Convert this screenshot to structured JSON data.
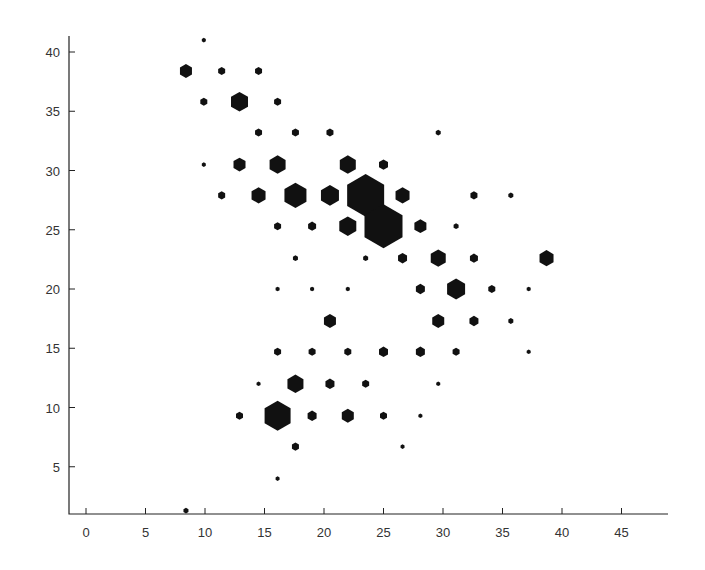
{
  "chart_data": {
    "type": "scatter",
    "subtype": "hexbin",
    "title": "",
    "xlabel": "",
    "ylabel": "",
    "xlim": [
      -1.5,
      49
    ],
    "ylim": [
      1,
      41.5
    ],
    "xticks": [
      0,
      5,
      10,
      15,
      20,
      25,
      30,
      35,
      40,
      45
    ],
    "yticks": [
      5,
      10,
      15,
      20,
      25,
      30,
      35,
      40
    ],
    "grid": false,
    "legend": null,
    "marker": "hexagon (size proportional to count)",
    "color": "#111111",
    "points": [
      {
        "x": 9.9,
        "y": 41.0,
        "size": 4
      },
      {
        "x": 8.4,
        "y": 38.4,
        "size": 12
      },
      {
        "x": 11.4,
        "y": 38.4,
        "size": 7
      },
      {
        "x": 14.5,
        "y": 38.4,
        "size": 7
      },
      {
        "x": 9.9,
        "y": 35.8,
        "size": 7
      },
      {
        "x": 12.9,
        "y": 35.8,
        "size": 17
      },
      {
        "x": 16.1,
        "y": 35.8,
        "size": 7
      },
      {
        "x": 14.5,
        "y": 33.2,
        "size": 7
      },
      {
        "x": 17.6,
        "y": 33.2,
        "size": 7
      },
      {
        "x": 20.5,
        "y": 33.2,
        "size": 7
      },
      {
        "x": 29.6,
        "y": 33.2,
        "size": 5
      },
      {
        "x": 9.9,
        "y": 30.5,
        "size": 4
      },
      {
        "x": 12.9,
        "y": 30.5,
        "size": 12
      },
      {
        "x": 16.1,
        "y": 30.5,
        "size": 16
      },
      {
        "x": 22.0,
        "y": 30.5,
        "size": 16
      },
      {
        "x": 25.0,
        "y": 30.5,
        "size": 9
      },
      {
        "x": 11.4,
        "y": 27.9,
        "size": 7
      },
      {
        "x": 14.5,
        "y": 27.9,
        "size": 14
      },
      {
        "x": 17.6,
        "y": 27.9,
        "size": 22
      },
      {
        "x": 20.5,
        "y": 27.9,
        "size": 18
      },
      {
        "x": 23.5,
        "y": 27.9,
        "size": 37
      },
      {
        "x": 26.6,
        "y": 27.9,
        "size": 14
      },
      {
        "x": 32.6,
        "y": 27.9,
        "size": 7
      },
      {
        "x": 35.7,
        "y": 27.9,
        "size": 5
      },
      {
        "x": 16.1,
        "y": 25.3,
        "size": 7
      },
      {
        "x": 19.0,
        "y": 25.3,
        "size": 8
      },
      {
        "x": 22.0,
        "y": 25.3,
        "size": 17
      },
      {
        "x": 25.0,
        "y": 25.3,
        "size": 38
      },
      {
        "x": 28.1,
        "y": 25.3,
        "size": 12
      },
      {
        "x": 31.1,
        "y": 25.3,
        "size": 5
      },
      {
        "x": 17.6,
        "y": 22.6,
        "size": 5
      },
      {
        "x": 23.5,
        "y": 22.6,
        "size": 5
      },
      {
        "x": 26.6,
        "y": 22.6,
        "size": 9
      },
      {
        "x": 29.6,
        "y": 22.6,
        "size": 15
      },
      {
        "x": 32.6,
        "y": 22.6,
        "size": 8
      },
      {
        "x": 38.7,
        "y": 22.6,
        "size": 14
      },
      {
        "x": 16.1,
        "y": 20.0,
        "size": 4
      },
      {
        "x": 19.0,
        "y": 20.0,
        "size": 4
      },
      {
        "x": 22.0,
        "y": 20.0,
        "size": 4
      },
      {
        "x": 28.1,
        "y": 20.0,
        "size": 9
      },
      {
        "x": 31.1,
        "y": 20.0,
        "size": 18
      },
      {
        "x": 34.1,
        "y": 20.0,
        "size": 7
      },
      {
        "x": 37.2,
        "y": 20.0,
        "size": 4
      },
      {
        "x": 20.5,
        "y": 17.3,
        "size": 12
      },
      {
        "x": 29.6,
        "y": 17.3,
        "size": 12
      },
      {
        "x": 32.6,
        "y": 17.3,
        "size": 9
      },
      {
        "x": 35.7,
        "y": 17.3,
        "size": 5
      },
      {
        "x": 16.1,
        "y": 14.7,
        "size": 7
      },
      {
        "x": 19.0,
        "y": 14.7,
        "size": 7
      },
      {
        "x": 22.0,
        "y": 14.7,
        "size": 7
      },
      {
        "x": 25.0,
        "y": 14.7,
        "size": 9
      },
      {
        "x": 28.1,
        "y": 14.7,
        "size": 9
      },
      {
        "x": 31.1,
        "y": 14.7,
        "size": 7
      },
      {
        "x": 37.2,
        "y": 14.7,
        "size": 4
      },
      {
        "x": 14.5,
        "y": 12.0,
        "size": 4
      },
      {
        "x": 17.6,
        "y": 12.0,
        "size": 16
      },
      {
        "x": 20.5,
        "y": 12.0,
        "size": 9
      },
      {
        "x": 23.5,
        "y": 12.0,
        "size": 7
      },
      {
        "x": 29.6,
        "y": 12.0,
        "size": 4
      },
      {
        "x": 12.9,
        "y": 9.3,
        "size": 7
      },
      {
        "x": 16.1,
        "y": 9.3,
        "size": 26
      },
      {
        "x": 19.0,
        "y": 9.3,
        "size": 9
      },
      {
        "x": 22.0,
        "y": 9.3,
        "size": 12
      },
      {
        "x": 25.0,
        "y": 9.3,
        "size": 7
      },
      {
        "x": 28.1,
        "y": 9.3,
        "size": 4
      },
      {
        "x": 17.6,
        "y": 6.7,
        "size": 7
      },
      {
        "x": 26.6,
        "y": 6.7,
        "size": 4
      },
      {
        "x": 16.1,
        "y": 4.0,
        "size": 4
      },
      {
        "x": 8.4,
        "y": 1.3,
        "size": 5
      }
    ]
  },
  "axes": {
    "x_tick_labels": [
      "0",
      "5",
      "10",
      "15",
      "20",
      "25",
      "30",
      "35",
      "40",
      "45"
    ],
    "y_tick_labels": [
      "5",
      "10",
      "15",
      "20",
      "25",
      "30",
      "35",
      "40"
    ]
  }
}
